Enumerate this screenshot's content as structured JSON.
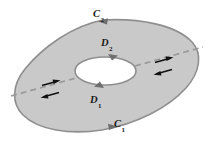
{
  "figure": {
    "background_color": "#ffffff",
    "region_fill_color": "#c9c9c9",
    "region_stroke_color": "#8f8f8f",
    "hole_fill_color": "#ffffff",
    "dashed_line_color": "#9a9a9a",
    "arrow_color": "#111111",
    "label_color": "#1a1a1a"
  },
  "labels": {
    "c2": {
      "letter": "C",
      "subscript": "2",
      "text": "C2"
    },
    "d2": {
      "letter": "D",
      "subscript": "2",
      "text": "D2"
    },
    "d1": {
      "letter": "D",
      "subscript": "1",
      "text": "D1"
    },
    "c1": {
      "letter": "C",
      "subscript": "1",
      "text": "C1"
    }
  },
  "elements": {
    "outer_boundary_name": "outer-boundary-curve",
    "inner_boundary_name": "inner-hole-curve",
    "cut_line_name": "dashed-cut-line",
    "outer_arrow_top_direction": "left",
    "outer_arrow_bottom_direction": "right",
    "inner_arrow_top_direction": "right",
    "inner_arrow_bottom_direction": "left",
    "cut_arrow_pair_left": [
      "right",
      "left"
    ],
    "cut_arrow_pair_right": [
      "right",
      "left"
    ]
  }
}
